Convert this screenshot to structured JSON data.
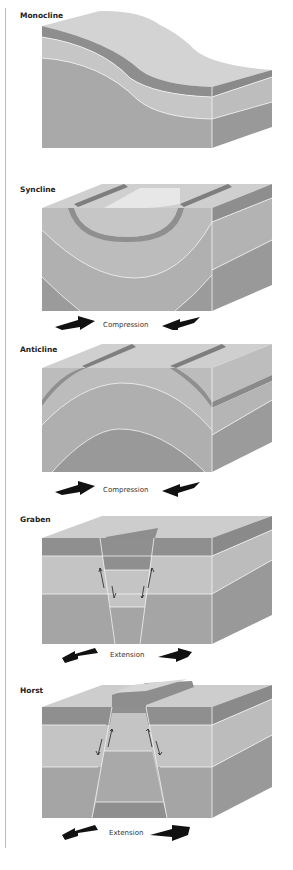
{
  "panels": [
    {
      "title": "Monocline",
      "force": ""
    },
    {
      "title": "Syncline",
      "force": "Compression"
    },
    {
      "title": "Anticline",
      "force": "Compression"
    },
    {
      "title": "Graben",
      "force": "Extension"
    },
    {
      "title": "Horst",
      "force": "Extension"
    }
  ],
  "colors": {
    "top_surface": "#d2d2d2",
    "dark_layer": "#8f8f8f",
    "light_layer": "#c4c4c4",
    "mid_layer": "#adadad",
    "side_dark": "#9a9a9a",
    "boundary": "#f4f4f4",
    "arrow": "#111111"
  }
}
